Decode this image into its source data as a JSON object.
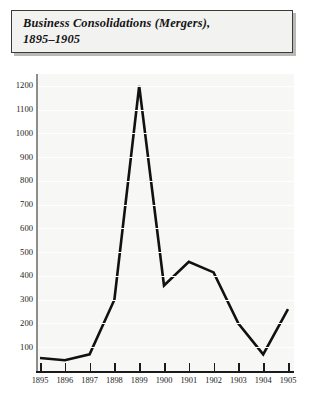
{
  "chart_data": {
    "type": "line",
    "title": "Business Consolidations (Mergers),\n1895–1905",
    "xlabel": "",
    "ylabel": "",
    "categories": [
      "1895",
      "1896",
      "1897",
      "1898",
      "1899",
      "1900",
      "1901",
      "1902",
      "1903",
      "1904",
      "1905"
    ],
    "x": [
      1895,
      1896,
      1897,
      1898,
      1899,
      1900,
      1901,
      1902,
      1903,
      1904,
      1905
    ],
    "values": [
      55,
      45,
      70,
      300,
      1200,
      360,
      460,
      415,
      200,
      70,
      260
    ],
    "series": [
      {
        "name": "Business Consolidations (Mergers)",
        "values": [
          55,
          45,
          70,
          300,
          1200,
          360,
          460,
          415,
          200,
          70,
          260
        ]
      }
    ],
    "ylim": [
      0,
      1250
    ],
    "yticks": [
      100,
      200,
      300,
      400,
      500,
      600,
      700,
      800,
      900,
      1000,
      1100,
      1200
    ],
    "ytick_labels": [
      "100",
      "200",
      "300",
      "400",
      "500",
      "600",
      "700",
      "800",
      "900",
      "1000",
      "1100",
      "1200"
    ],
    "xlim": [
      1895,
      1905
    ],
    "grid": true,
    "grid_axis": "y",
    "legend": false,
    "legend_position": "none",
    "line_color": "#111111",
    "plot_background": "#f7f7f6",
    "page_background": "#ffffff"
  },
  "title_box": {
    "text": "Business Consolidations (Mergers),\n1895–1905",
    "background": "#f2f2f0",
    "border_color": "#3a3a38",
    "shadow_color": "#b9b9b6"
  }
}
